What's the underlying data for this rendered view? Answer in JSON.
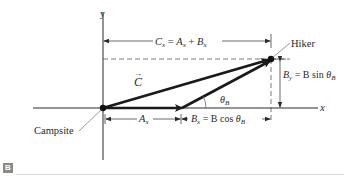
{
  "figure": {
    "tag": "B",
    "colors": {
      "line": "#2a2a2a",
      "dashed": "#555555",
      "rule": "#dcdcdc",
      "tag_bg": "#8a8a8a"
    }
  },
  "axes": {
    "x_label": "x",
    "y_label": "y"
  },
  "points": {
    "origin_label": "Campsite",
    "end_label": "Hiker"
  },
  "vectors": {
    "resultant_label": "C",
    "resultant_arrow_glyph": "→",
    "angle_label_base": "θ",
    "angle_label_sub": "B"
  },
  "dimensions": {
    "cx": {
      "lhs": "C",
      "lhs_sub": "x",
      "eq": " = ",
      "a": "A",
      "a_sub": "x",
      "plus": " + ",
      "b": "B",
      "b_sub": "x"
    },
    "ax": {
      "base": "A",
      "sub": "x"
    },
    "bx": {
      "lhs": "B",
      "lhs_sub": "x",
      "eq": " = ",
      "rhs": "B cos ",
      "theta": "θ",
      "theta_sub": "B"
    },
    "by": {
      "lhs": "B",
      "lhs_sub": "y",
      "eq": " = ",
      "rhs": "B sin ",
      "theta": "θ",
      "theta_sub": "B"
    }
  }
}
